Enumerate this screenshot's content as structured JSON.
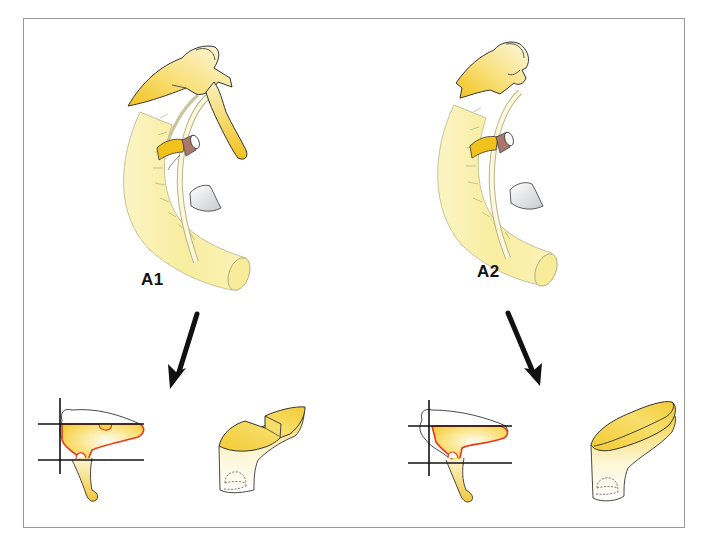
{
  "figure": {
    "panels": [
      {
        "id": "A1",
        "label": "A1"
      },
      {
        "id": "A2",
        "label": "A2"
      }
    ],
    "colors": {
      "yellow_dark": "#f2c21c",
      "yellow_mid": "#f7df6a",
      "yellow_light": "#fbf3b8",
      "outline": "#333333",
      "red_outline": "#e8391d",
      "arrow": "#111111",
      "frame": "#9a9a9a",
      "gray_leaf": "#d9dadb",
      "brown": "#a9776c"
    },
    "icons": [
      "arrow-down-left-icon",
      "arrow-down-right-icon"
    ]
  }
}
